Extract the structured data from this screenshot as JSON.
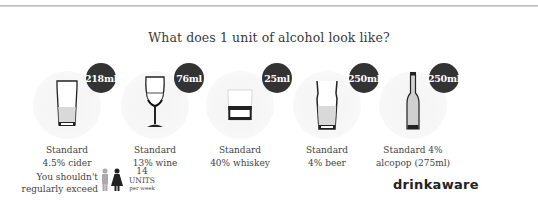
{
  "title": "What does 1 unit of alcohol look like?",
  "drinks": [
    {
      "name": "cider",
      "volume": "218ml",
      "label_line1": "Standard",
      "label_line2": "4.5% cider",
      "icon": "pint-glass-icon"
    },
    {
      "name": "wine",
      "volume": "76ml",
      "label_line1": "Standard",
      "label_line2": "13% wine",
      "icon": "wine-glass-icon"
    },
    {
      "name": "whiskey",
      "volume": "25ml",
      "label_line1": "Standard",
      "label_line2": "40% whiskey",
      "icon": "tumbler-glass-icon"
    },
    {
      "name": "beer",
      "volume": "250ml",
      "label_line1": "Standard",
      "label_line2": "4% beer",
      "icon": "beer-glass-icon"
    },
    {
      "name": "alcopop",
      "volume": "250ml",
      "label_line1": "Standard 4%",
      "label_line2": "alcopop (275ml)",
      "icon": "bottle-icon"
    }
  ],
  "guideline": {
    "line1": "You shouldn't",
    "line2": "regularly exceed",
    "icon": "man-woman-icon",
    "units_number": "14",
    "units_label": "UNITS",
    "units_period": "per week"
  },
  "brand": "drinkaware",
  "colors": {
    "badge": "#333333",
    "text": "#444444",
    "background": "#ffffff",
    "circle_bg": "#f5f5f5"
  }
}
